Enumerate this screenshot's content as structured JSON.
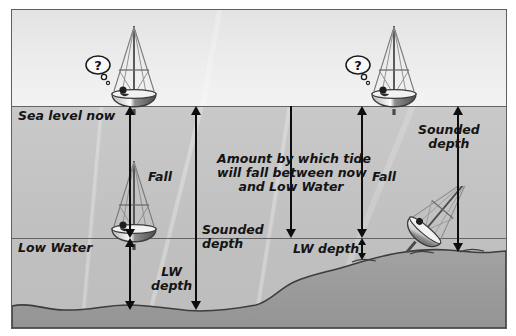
{
  "diagram": {
    "labels": {
      "sea_level_now": "Sea level now",
      "low_water": "Low Water",
      "fall_left": "Fall",
      "fall_right": "Fall",
      "lw_depth_left": "LW\ndepth",
      "lw_depth_right": "LW depth",
      "sounded_depth_left": "Sounded\ndepth",
      "sounded_depth_right": "Sounded\ndepth",
      "amount_note": "Amount by which tide\nwill fall between now\nand Low Water"
    },
    "thought_bubble": "?",
    "colors": {
      "sky": "#ebebeb",
      "water_upper": "#c6c6c6",
      "water_lower": "#bebebe",
      "seabed": "#9a9a9a",
      "line": "#646464",
      "arrow": "#0d0d0d",
      "text": "#141414",
      "frame": "#5f5f5f",
      "page": "#ffffff"
    },
    "levels": {
      "sea_level_y": 96,
      "low_water_y": 228
    }
  }
}
